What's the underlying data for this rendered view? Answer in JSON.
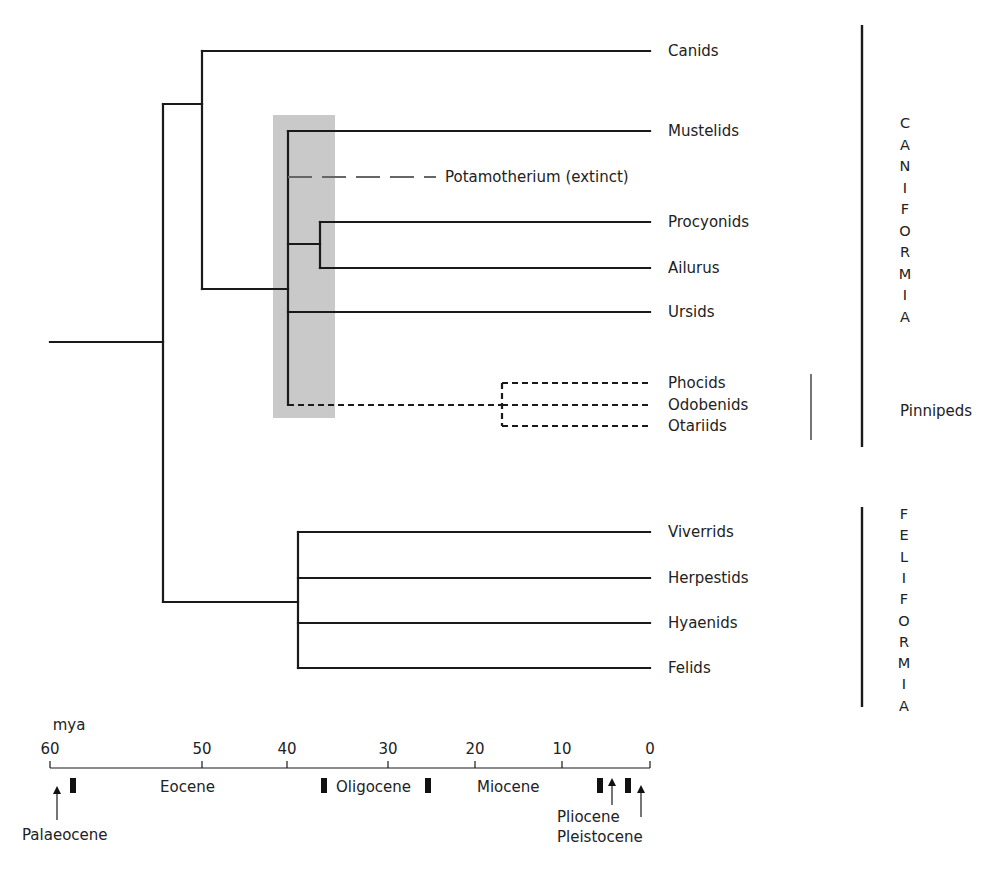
{
  "chart_data": {
    "type": "phylogenetic-tree",
    "title": "",
    "axis": {
      "unit_label": "mya",
      "ticks": [
        {
          "value": "60",
          "x": 50
        },
        {
          "value": "50",
          "x": 202
        },
        {
          "value": "40",
          "x": 287
        },
        {
          "value": "30",
          "x": 388
        },
        {
          "value": "20",
          "x": 475
        },
        {
          "value": "10",
          "x": 562
        },
        {
          "value": "0",
          "x": 650
        }
      ]
    },
    "epochs": [
      {
        "name": "Palaeocene",
        "x": 22,
        "y": 840,
        "arrow_x": 57
      },
      {
        "name": "Eocene",
        "x": 160,
        "y": 792
      },
      {
        "name": "Oligocene",
        "x": 336,
        "y": 792
      },
      {
        "name": "Miocene",
        "x": 477,
        "y": 792
      },
      {
        "name": "Pliocene",
        "x": 557,
        "y": 822,
        "arrow_x": 612
      },
      {
        "name": "Pleistocene",
        "x": 557,
        "y": 842,
        "arrow_x": 641
      }
    ],
    "epoch_boundary_markers_x": [
      73,
      324,
      428,
      600,
      628
    ],
    "taxa": [
      {
        "name": "Canids",
        "y": 51,
        "group": "Caniformia",
        "type": "extant"
      },
      {
        "name": "Mustelids",
        "y": 131,
        "group": "Caniformia",
        "type": "extant"
      },
      {
        "name": "Potamotherium (extinct)",
        "y": 177,
        "group": "Caniformia",
        "type": "extinct"
      },
      {
        "name": "Procyonids",
        "y": 222,
        "group": "Caniformia",
        "type": "extant"
      },
      {
        "name": "Ailurus",
        "y": 268,
        "group": "Caniformia",
        "type": "extant"
      },
      {
        "name": "Ursids",
        "y": 312,
        "group": "Caniformia",
        "type": "extant"
      },
      {
        "name": "Phocids",
        "y": 383,
        "group": "Pinnipeds",
        "type": "uncertain"
      },
      {
        "name": "Odobenids",
        "y": 405,
        "group": "Pinnipeds",
        "type": "uncertain"
      },
      {
        "name": "Otariids",
        "y": 426,
        "group": "Pinnipeds",
        "type": "uncertain"
      },
      {
        "name": "Viverrids",
        "y": 532,
        "group": "Feliformia",
        "type": "extant"
      },
      {
        "name": "Herpestids",
        "y": 578,
        "group": "Feliformia",
        "type": "extant"
      },
      {
        "name": "Hyaenids",
        "y": 623,
        "group": "Feliformia",
        "type": "extant"
      },
      {
        "name": "Felids",
        "y": 668,
        "group": "Feliformia",
        "type": "extant"
      }
    ],
    "groups": [
      {
        "name": "Caniformia",
        "letters": [
          "C",
          "A",
          "N",
          "I",
          "F",
          "O",
          "R",
          "M",
          "I",
          "A"
        ],
        "bar_x": 862,
        "bar_y1": 25,
        "bar_y2": 447,
        "letter_x": 905,
        "letter_y0": 123,
        "letter_step": 21.5
      },
      {
        "name": "Pinnipeds",
        "label": "Pinnipeds",
        "bar_x": 811,
        "bar_y1": 374,
        "bar_y2": 440,
        "label_x": 900,
        "label_y": 411
      },
      {
        "name": "Feliformia",
        "letters": [
          "F",
          "E",
          "L",
          "I",
          "F",
          "O",
          "R",
          "M",
          "I",
          "A"
        ],
        "bar_x": 862,
        "bar_y1": 507,
        "bar_y2": 707,
        "letter_x": 904,
        "letter_y0": 514,
        "letter_step": 21.3
      }
    ],
    "highlight_region": {
      "x": 273,
      "y": 115,
      "width": 62,
      "height": 303,
      "color": "#c9c9c9",
      "approx_age_mya": "~42-36"
    },
    "nodes": {
      "root": {
        "x": 163,
        "y_top": 104,
        "y_bottom": 602,
        "stem_x0": 50,
        "stem_y": 342
      },
      "caniformia": {
        "x": 202,
        "y_top": 51,
        "y_bottom": 289
      },
      "arctoidea": {
        "x": 288,
        "y_top": 131,
        "y_bottom": 405
      },
      "musteloidea_proc_ail": {
        "x": 320,
        "y_top": 222,
        "y_bottom": 268,
        "stem_y": 244
      },
      "pinnipedia": {
        "x": 502,
        "y_top": 383,
        "y_bottom": 426
      },
      "feliformia": {
        "x": 298,
        "y_top": 532,
        "y_bottom": 668
      }
    },
    "tip_x": 650
  }
}
